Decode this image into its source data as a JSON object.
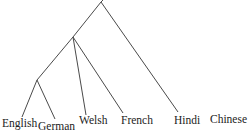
{
  "diagram": {
    "type": "tree",
    "leaves": [
      {
        "id": "english",
        "label": "English",
        "x": 2,
        "y": 127,
        "tip": [
          22,
          117
        ]
      },
      {
        "id": "german",
        "label": "German",
        "x": 38,
        "y": 130,
        "tip": [
          55,
          119
        ]
      },
      {
        "id": "welsh",
        "label": "Welsh",
        "x": 79,
        "y": 124,
        "tip": [
          86,
          115
        ]
      },
      {
        "id": "french",
        "label": "French",
        "x": 121,
        "y": 124,
        "tip": [
          123,
          113
        ]
      },
      {
        "id": "hindi",
        "label": "Hindi",
        "x": 174,
        "y": 124,
        "tip": [
          178,
          112
        ]
      },
      {
        "id": "chinese",
        "label": "Chinese",
        "x": 210,
        "y": 123,
        "tip": null
      }
    ],
    "internal_nodes": [
      {
        "id": "root",
        "pos": [
          101,
          2
        ]
      },
      {
        "id": "n_middle",
        "pos": [
          73,
          37
        ]
      },
      {
        "id": "n_lower",
        "pos": [
          37,
          80
        ]
      }
    ],
    "edges": [
      {
        "from": "root",
        "to": "n_middle"
      },
      {
        "from": "root",
        "to": "hindi"
      },
      {
        "from": "n_middle",
        "to": "n_lower"
      },
      {
        "from": "n_middle",
        "to": "welsh"
      },
      {
        "from": "n_middle",
        "to": "french"
      },
      {
        "from": "n_lower",
        "to": "english"
      },
      {
        "from": "n_lower",
        "to": "german"
      }
    ]
  }
}
